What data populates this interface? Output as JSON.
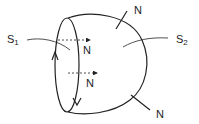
{
  "diagram": {
    "surfaces": [
      {
        "id": "S1",
        "label": "S",
        "subscript": "1",
        "description": "disc surface bounded by the loop"
      },
      {
        "id": "S2",
        "label": "S",
        "subscript": "2",
        "description": "balloon surface bounded by the loop"
      }
    ],
    "normals": [
      {
        "label": "N",
        "location": "on S1, upper dashed arrow"
      },
      {
        "label": "N",
        "location": "on S1, lower dashed arrow"
      },
      {
        "label": "N",
        "location": "on S2, top outward"
      },
      {
        "label": "N",
        "location": "on S2, bottom-right outward"
      }
    ],
    "stroke_color": "#222222"
  }
}
